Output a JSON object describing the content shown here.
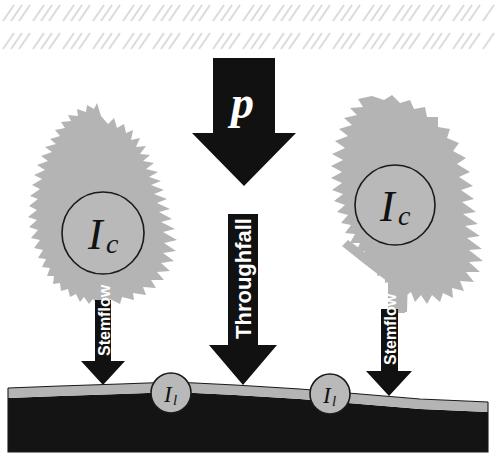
{
  "figure": {
    "background_color": "#ffffff"
  },
  "palette": {
    "rain_hatch": "#dcdcdc",
    "vegetation_gray": "#b4b4b4",
    "arrow_black": "#111111",
    "soil_black": "#141414",
    "litter_gray": "#b4b4b4",
    "store_fill": "#b9b9b9",
    "store_stroke": "#1a1a1a",
    "label_white": "#ffffff"
  },
  "rain": {
    "name": "precipitation-hatching",
    "symbol": "p",
    "rows": 2,
    "columns": 17,
    "strokes_per_cell": 3,
    "direction": "diagonal-down-left"
  },
  "fluxes": [
    {
      "id": "precipitation",
      "label": "p",
      "label_style": "italic-serif-white",
      "orientation": "vertical-down",
      "color": "#111111"
    },
    {
      "id": "throughfall",
      "label": "Throughfall",
      "label_style": "bold-sans-white-rotated",
      "orientation": "vertical-down",
      "color": "#111111"
    },
    {
      "id": "stemflow-left",
      "label": "Stemflow",
      "label_style": "bold-sans-white-rotated",
      "orientation": "vertical-down",
      "color": "#111111"
    },
    {
      "id": "stemflow-right",
      "label": "Stemflow",
      "label_style": "bold-sans-white-rotated",
      "orientation": "vertical-down",
      "color": "#111111"
    }
  ],
  "stores": [
    {
      "id": "canopy-interception-left",
      "symbol": "I",
      "subscript": "c",
      "located_on": "conifer-tree-crown"
    },
    {
      "id": "canopy-interception-right",
      "symbol": "I",
      "subscript": "c",
      "located_on": "broadleaf-tree-crown"
    },
    {
      "id": "litter-interception-left",
      "symbol": "I",
      "subscript": "l",
      "located_on": "litter-layer"
    },
    {
      "id": "litter-interception-right",
      "symbol": "I",
      "subscript": "l",
      "located_on": "litter-layer"
    }
  ],
  "vegetation": [
    {
      "id": "tree-left",
      "type": "conifer",
      "color": "#b4b4b4"
    },
    {
      "id": "tree-right",
      "type": "broadleaf",
      "color": "#b4b4b4"
    }
  ],
  "ground": {
    "litter_label": "litter layer",
    "soil_label": "soil",
    "litter_color": "#b4b4b4",
    "soil_color": "#141414"
  },
  "labels": {
    "precipitation": "p",
    "throughfall": "Throughfall",
    "stemflow_left": "Stemflow",
    "stemflow_right": "Stemflow",
    "canopy_symbol": "I",
    "canopy_subscript": "c",
    "litter_symbol": "I",
    "litter_subscript": "l"
  }
}
